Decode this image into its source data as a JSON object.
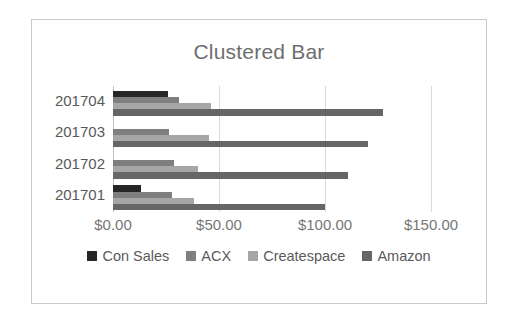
{
  "chart_data": {
    "type": "bar",
    "orientation": "horizontal",
    "title": "Clustered Bar",
    "xlabel": "",
    "ylabel": "",
    "categories": [
      "201704",
      "201703",
      "201702",
      "201701"
    ],
    "series": [
      {
        "name": "Con Sales",
        "color": "#262626",
        "values": [
          26.0,
          0.0,
          0.0,
          13.0
        ]
      },
      {
        "name": "ACX",
        "color": "#7f7f7f",
        "values": [
          31.0,
          26.5,
          29.0,
          28.0
        ]
      },
      {
        "name": "Createspace",
        "color": "#a6a6a6",
        "values": [
          46.0,
          45.5,
          40.0,
          38.0
        ]
      },
      {
        "name": "Amazon",
        "color": "#666666",
        "values": [
          127.5,
          120.5,
          111.0,
          100.0
        ]
      }
    ],
    "xlim": [
      0,
      150
    ],
    "tick_values": [
      0,
      50,
      100,
      150
    ],
    "tick_labels": [
      "$0.00",
      "$50.00",
      "$100.00",
      "$150.00"
    ],
    "grid": true,
    "legend_position": "bottom",
    "frame_color": "#c9c9c9",
    "title_color": "#6e6e6e",
    "axis_text_color": "#767676",
    "gridline_color": "#d9d9d9"
  }
}
